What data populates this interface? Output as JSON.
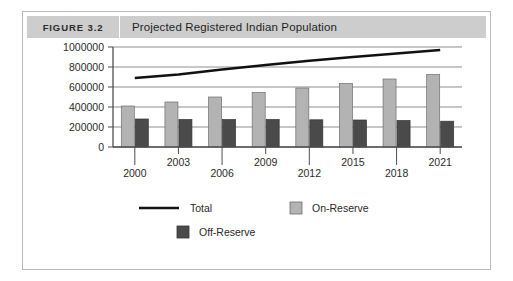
{
  "figure": {
    "tag": "FIGURE 3.2",
    "title": "Projected Registered Indian Population"
  },
  "colors": {
    "on_reserve": "#b3b3b3",
    "off_reserve": "#4a4a4a",
    "total_line": "#111111",
    "grid": "#8f8f8f",
    "axis": "#4f4f4f",
    "header_band": "#cdcdcd",
    "card_border": "#b9b9b9"
  },
  "chart_data": {
    "type": "bar",
    "title": "Projected Registered Indian Population",
    "xlabel": "",
    "ylabel": "",
    "ylim": [
      0,
      1000000
    ],
    "yticks": [
      0,
      200000,
      400000,
      600000,
      800000,
      1000000
    ],
    "ytick_labels": [
      "0",
      "200000",
      "400000",
      "600000",
      "800000",
      "1000000"
    ],
    "grid": true,
    "legend_position": "bottom",
    "categories": [
      "2000",
      "2003",
      "2006",
      "2009",
      "2012",
      "2015",
      "2018",
      "2021"
    ],
    "series": [
      {
        "name": "On-Reserve",
        "type": "bar",
        "color": "#b3b3b3",
        "values": [
          410000,
          450000,
          500000,
          545000,
          590000,
          635000,
          680000,
          725000
        ]
      },
      {
        "name": "Off-Reserve",
        "type": "bar",
        "color": "#4a4a4a",
        "values": [
          280000,
          275000,
          275000,
          275000,
          272000,
          270000,
          265000,
          258000
        ]
      },
      {
        "name": "Total",
        "type": "line",
        "color": "#111111",
        "values": [
          690000,
          725000,
          775000,
          820000,
          862000,
          900000,
          935000,
          970000
        ]
      }
    ]
  },
  "legend": {
    "items": [
      {
        "label": "Total",
        "marker": "line",
        "color": "#111111"
      },
      {
        "label": "On-Reserve",
        "marker": "swatch",
        "color": "#b3b3b3"
      },
      {
        "label": "Off-Reserve",
        "marker": "swatch",
        "color": "#4a4a4a"
      }
    ]
  }
}
